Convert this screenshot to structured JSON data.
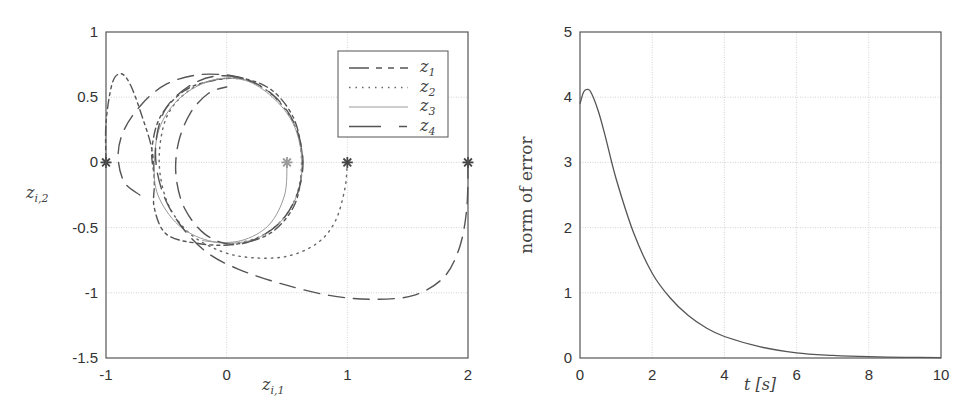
{
  "chart_data": [
    {
      "type": "line",
      "title": "",
      "xlabel": "z_{i,1}",
      "ylabel": "z_{i,2}",
      "xlim": [
        -1,
        2
      ],
      "ylim": [
        -1.5,
        1
      ],
      "xticks": [
        "-1",
        "0",
        "1",
        "2"
      ],
      "yticks": [
        "1",
        "0.5",
        "0",
        "-0.5",
        "-1",
        "-1.5"
      ],
      "grid": true,
      "legend_position": "upper right",
      "legend": [
        {
          "name": "z1",
          "base": "z",
          "sub": "1",
          "style": "dash-dot",
          "color": "#555555"
        },
        {
          "name": "z2",
          "base": "z",
          "sub": "2",
          "style": "dotted",
          "color": "#666666"
        },
        {
          "name": "z3",
          "base": "z",
          "sub": "3",
          "style": "solid",
          "color": "#9a9a9a"
        },
        {
          "name": "z4",
          "base": "z",
          "sub": "4",
          "style": "long-dash",
          "color": "#555555"
        }
      ],
      "markers": [
        {
          "x": -1,
          "y": 0,
          "symbol": "*",
          "color": "#444444"
        },
        {
          "x": 0.5,
          "y": 0,
          "symbol": "*",
          "color": "#9a9a9a"
        },
        {
          "x": 1,
          "y": 0,
          "symbol": "*",
          "color": "#444444"
        },
        {
          "x": 2,
          "y": 0,
          "symbol": "*",
          "color": "#444444"
        }
      ],
      "series": [
        {
          "name": "z1",
          "points": [
            [
              -1,
              0
            ],
            [
              -1,
              0.3
            ],
            [
              -0.95,
              0.6
            ],
            [
              -0.88,
              0.68
            ],
            [
              -0.8,
              0.6
            ],
            [
              -0.7,
              0.35
            ],
            [
              -0.62,
              0.1
            ],
            [
              -0.6,
              -0.15
            ],
            [
              -0.6,
              -0.35
            ],
            [
              -0.5,
              -0.55
            ],
            [
              -0.25,
              -0.62
            ],
            [
              0.05,
              -0.63
            ],
            [
              0.35,
              -0.55
            ],
            [
              0.55,
              -0.35
            ],
            [
              0.62,
              -0.1
            ],
            [
              0.62,
              0.1
            ],
            [
              0.55,
              0.35
            ],
            [
              0.38,
              0.55
            ],
            [
              0.15,
              0.64
            ],
            [
              -0.1,
              0.63
            ],
            [
              -0.35,
              0.55
            ],
            [
              -0.55,
              0.35
            ],
            [
              -0.62,
              0.1
            ],
            [
              -0.6,
              -0.1
            ]
          ]
        },
        {
          "name": "z2",
          "points": [
            [
              1,
              0
            ],
            [
              0.98,
              -0.2
            ],
            [
              0.9,
              -0.45
            ],
            [
              0.75,
              -0.62
            ],
            [
              0.5,
              -0.72
            ],
            [
              0.2,
              -0.73
            ],
            [
              -0.05,
              -0.68
            ],
            [
              -0.3,
              -0.55
            ],
            [
              -0.47,
              -0.35
            ],
            [
              -0.55,
              -0.1
            ],
            [
              -0.55,
              0.15
            ],
            [
              -0.48,
              0.38
            ],
            [
              -0.3,
              0.56
            ],
            [
              -0.05,
              0.64
            ],
            [
              0.2,
              0.62
            ],
            [
              0.42,
              0.48
            ],
            [
              0.58,
              0.25
            ],
            [
              0.62,
              0
            ],
            [
              0.58,
              -0.25
            ],
            [
              0.45,
              -0.45
            ],
            [
              0.25,
              -0.58
            ],
            [
              0,
              -0.63
            ]
          ]
        },
        {
          "name": "z3",
          "points": [
            [
              0.5,
              0
            ],
            [
              0.48,
              -0.25
            ],
            [
              0.35,
              -0.48
            ],
            [
              0.12,
              -0.6
            ],
            [
              -0.15,
              -0.6
            ],
            [
              -0.4,
              -0.48
            ],
            [
              -0.57,
              -0.25
            ],
            [
              -0.6,
              0
            ],
            [
              -0.55,
              0.28
            ],
            [
              -0.38,
              0.5
            ],
            [
              -0.12,
              0.63
            ],
            [
              0.15,
              0.63
            ],
            [
              0.38,
              0.5
            ],
            [
              0.55,
              0.3
            ],
            [
              0.62,
              0.05
            ],
            [
              0.6,
              -0.2
            ],
            [
              0.48,
              -0.42
            ],
            [
              0.28,
              -0.57
            ],
            [
              0.05,
              -0.62
            ],
            [
              -0.2,
              -0.6
            ]
          ]
        },
        {
          "name": "z4",
          "points": [
            [
              2,
              0
            ],
            [
              1.99,
              -0.35
            ],
            [
              1.93,
              -0.65
            ],
            [
              1.8,
              -0.88
            ],
            [
              1.55,
              -1.02
            ],
            [
              1.2,
              -1.05
            ],
            [
              0.85,
              -1.02
            ],
            [
              0.45,
              -0.93
            ],
            [
              0.1,
              -0.82
            ],
            [
              -0.15,
              -0.7
            ],
            [
              -0.35,
              -0.52
            ],
            [
              -0.5,
              -0.3
            ],
            [
              -0.58,
              -0.05
            ],
            [
              -0.58,
              0.2
            ],
            [
              -0.5,
              0.42
            ],
            [
              -0.32,
              0.58
            ],
            [
              -0.1,
              0.66
            ],
            [
              0.15,
              0.64
            ],
            [
              0.38,
              0.52
            ],
            [
              0.55,
              0.32
            ],
            [
              0.63,
              0.05
            ],
            [
              0.6,
              -0.2
            ],
            [
              0.48,
              -0.42
            ],
            [
              0.28,
              -0.57
            ],
            [
              0.05,
              -0.63
            ],
            [
              -0.18,
              -0.55
            ],
            [
              -0.35,
              -0.35
            ],
            [
              -0.42,
              -0.1
            ],
            [
              -0.4,
              0.15
            ],
            [
              -0.3,
              0.38
            ],
            [
              -0.15,
              0.53
            ],
            [
              0,
              0.58
            ]
          ]
        },
        {
          "name": "z4-tail",
          "points": [
            [
              -0.72,
              -0.25
            ],
            [
              -0.85,
              -0.15
            ],
            [
              -0.9,
              0.05
            ],
            [
              -0.85,
              0.25
            ],
            [
              -0.7,
              0.45
            ],
            [
              -0.5,
              0.6
            ],
            [
              -0.25,
              0.67
            ],
            [
              0.0,
              0.67
            ],
            [
              0.2,
              0.63
            ]
          ]
        }
      ]
    },
    {
      "type": "line",
      "title": "",
      "xlabel": "t [s]",
      "ylabel": "norm of error",
      "xlim": [
        0,
        10
      ],
      "ylim": [
        0,
        5
      ],
      "xticks": [
        "0",
        "2",
        "4",
        "6",
        "8",
        "10"
      ],
      "yticks": [
        "5",
        "4",
        "3",
        "2",
        "1",
        "0"
      ],
      "grid": true,
      "series": [
        {
          "name": "norm of error",
          "color": "#555555",
          "x": [
            0,
            0.1,
            0.2,
            0.3,
            0.5,
            0.7,
            1.0,
            1.5,
            2.0,
            2.5,
            3.0,
            3.5,
            4.0,
            5.0,
            6.0,
            7.0,
            8.0,
            9.0,
            10.0
          ],
          "y": [
            3.9,
            4.08,
            4.12,
            4.08,
            3.8,
            3.4,
            2.75,
            1.9,
            1.3,
            0.92,
            0.65,
            0.46,
            0.33,
            0.17,
            0.08,
            0.04,
            0.02,
            0.01,
            0.005
          ]
        }
      ]
    }
  ],
  "left_plot": {
    "xlabel_base": "z",
    "xlabel_sub": "i,1",
    "ylabel_base": "z",
    "ylabel_sub": "i,2"
  },
  "right_plot": {
    "xlabel": "t [s]",
    "ylabel": "norm of error"
  }
}
